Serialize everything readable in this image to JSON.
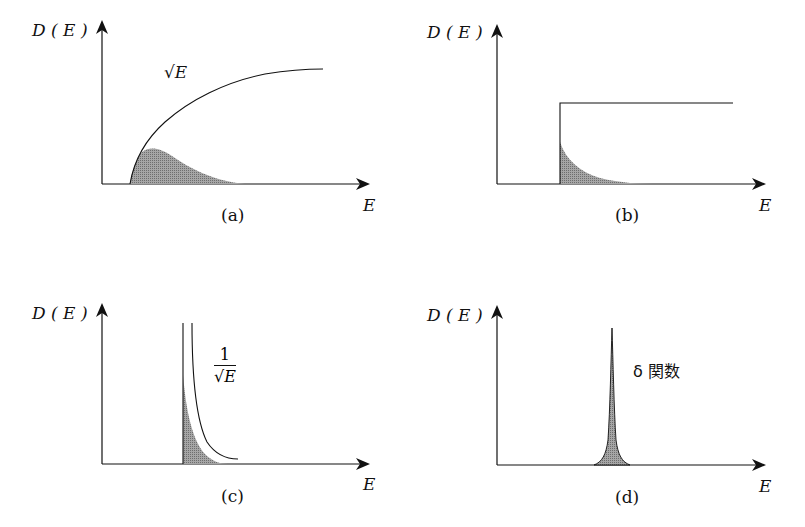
{
  "figure": {
    "panels": [
      {
        "id": "a",
        "caption": "(a)",
        "ylabel": "D(E)",
        "xlabel": "E",
        "curve_label": "√E",
        "shape": "sqrt",
        "description": "DOS ∝ √E with shaded occupied region"
      },
      {
        "id": "b",
        "caption": "(b)",
        "ylabel": "D(E)",
        "xlabel": "E",
        "curve_label": "",
        "shape": "step",
        "description": "Constant step DOS with shaded decaying occupation"
      },
      {
        "id": "c",
        "caption": "(c)",
        "ylabel": "D(E)",
        "xlabel": "E",
        "curve_label_num": "1",
        "curve_label_den": "√E",
        "shape": "inverse-sqrt",
        "description": "DOS ∝ 1/√E divergence with shaded region"
      },
      {
        "id": "d",
        "caption": "(d)",
        "ylabel": "D(E)",
        "xlabel": "E",
        "curve_label": "δ 関数",
        "shape": "delta",
        "description": "Delta-function DOS spike"
      }
    ],
    "colors": {
      "line": "#111111",
      "shade": "#8f8f8f",
      "background": "#ffffff"
    }
  },
  "labels": {
    "a": {
      "y": "D ( E )",
      "x": "E",
      "caption": "(a)",
      "curve": "√E"
    },
    "b": {
      "y": "D ( E )",
      "x": "E",
      "caption": "(b)"
    },
    "c": {
      "y": "D ( E )",
      "x": "E",
      "caption": "(c)",
      "num": "1",
      "den": "√E"
    },
    "d": {
      "y": "D ( E )",
      "x": "E",
      "caption": "(d)",
      "curve": "δ 関数"
    }
  }
}
